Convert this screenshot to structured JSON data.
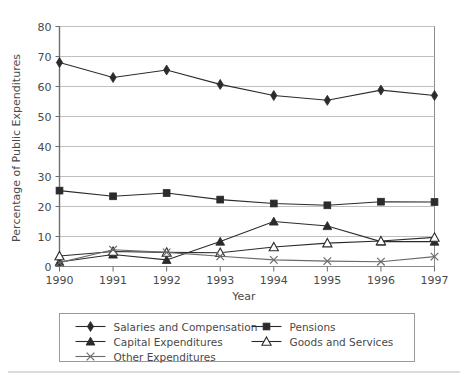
{
  "chart_data": {
    "type": "line",
    "title": "",
    "xlabel": "Year",
    "ylabel": "Percentage of Public Expenditures",
    "x": [
      1990,
      1991,
      1992,
      1993,
      1994,
      1995,
      1996,
      1997
    ],
    "categories": [
      "1990",
      "1991",
      "1992",
      "1993",
      "1994",
      "1995",
      "1996",
      "1997"
    ],
    "xlim": [
      1990,
      1997
    ],
    "ylim": [
      0,
      80
    ],
    "yticks": [
      0,
      10,
      20,
      30,
      40,
      50,
      60,
      70,
      80
    ],
    "ytick_labels": [
      "0",
      "10",
      "20",
      "30",
      "40",
      "50",
      "60",
      "70",
      "80"
    ],
    "xticks": [
      1990,
      1991,
      1992,
      1993,
      1994,
      1995,
      1996,
      1997
    ],
    "grid": "horizontal",
    "legend_position": "bottom",
    "series": [
      {
        "name": "Salaries and Compensation",
        "marker": "filled-diamond",
        "color": "#2b2b2b",
        "values": [
          68.0,
          63.0,
          65.5,
          60.7,
          57.0,
          55.4,
          58.8,
          57.0
        ]
      },
      {
        "name": "Pensions",
        "marker": "filled-square",
        "color": "#2b2b2b",
        "values": [
          25.3,
          23.4,
          24.5,
          22.3,
          21.0,
          20.4,
          21.6,
          21.5
        ]
      },
      {
        "name": "Capital Expenditures",
        "marker": "filled-triangle",
        "color": "#2b2b2b",
        "values": [
          1.5,
          4.0,
          2.2,
          8.3,
          15.0,
          13.5,
          8.3,
          8.3
        ]
      },
      {
        "name": "Goods and Services",
        "marker": "open-triangle",
        "color": "#2b2b2b",
        "values": [
          3.5,
          5.0,
          4.7,
          4.6,
          6.5,
          7.8,
          8.5,
          9.7
        ]
      },
      {
        "name": "Other Expenditures",
        "marker": "cross-x",
        "color": "#6a6a6a",
        "values": [
          1.3,
          5.6,
          4.7,
          3.4,
          2.2,
          1.8,
          1.6,
          3.3
        ]
      }
    ]
  },
  "legend": {
    "entries": [
      {
        "label": "Salaries and Compensation",
        "marker": "filled-diamond"
      },
      {
        "label": "Pensions",
        "marker": "filled-square"
      },
      {
        "label": "Capital Expenditures",
        "marker": "filled-triangle"
      },
      {
        "label": "Goods and Services",
        "marker": "open-triangle"
      },
      {
        "label": "Other Expenditures",
        "marker": "cross-x"
      }
    ]
  },
  "colors": {
    "background": "#ffffff",
    "plot_border": "#8c8c8c",
    "gridline": "#bfbfbf",
    "axis_line": "#6e6e6e",
    "series_dark": "#2b2b2b",
    "series_gray": "#6a6a6a",
    "text": "#4a4a4a",
    "legend_border": "#9a9a9a",
    "footer_rule": "#b8b8b8"
  }
}
